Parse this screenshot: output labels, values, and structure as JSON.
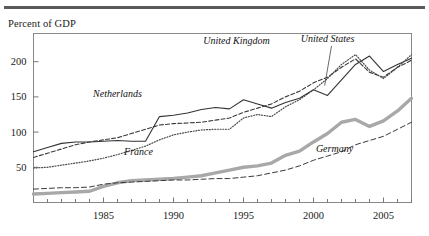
{
  "header": {
    "rule_color": "#5a5a5a"
  },
  "axis_title": "Percent of GDP",
  "chart_data": {
    "type": "line",
    "title": "",
    "subtitle": "",
    "xlabel": "",
    "ylabel": "Percent of GDP",
    "xlim": [
      1980,
      2007
    ],
    "ylim": [
      0,
      240
    ],
    "yticks": [
      50,
      100,
      150,
      200
    ],
    "ytick_labels": [
      "50",
      "100",
      "150",
      "200"
    ],
    "xticks": [
      1985,
      1990,
      1995,
      2000,
      2005
    ],
    "xtick_labels": [
      "1985",
      "1990",
      "1995",
      "2000",
      "2005"
    ],
    "minor_xticks_every": 1,
    "grid": false,
    "legend": "inline-annotations",
    "x": [
      1980,
      1981,
      1982,
      1983,
      1984,
      1985,
      1986,
      1987,
      1988,
      1989,
      1990,
      1991,
      1992,
      1993,
      1994,
      1995,
      1996,
      1997,
      1998,
      1999,
      2000,
      2001,
      2002,
      2003,
      2004,
      2005,
      2006,
      2007
    ],
    "series": [
      {
        "name": "Netherlands",
        "style": "solid-thin",
        "color": "#333333",
        "label_x": 1986.0,
        "label_y": 150,
        "values": [
          72,
          78,
          84,
          86,
          86,
          87,
          88,
          87,
          87,
          122,
          124,
          127,
          132,
          135,
          133,
          146,
          140,
          134,
          142,
          148,
          160,
          152,
          174,
          196,
          208,
          186,
          196,
          205
        ]
      },
      {
        "name": "United Kingdom",
        "style": "dotted",
        "color": "#4a4a4a",
        "label_x": 1994.5,
        "label_y": 225,
        "values": [
          49,
          50,
          53,
          56,
          59,
          63,
          68,
          74,
          80,
          89,
          96,
          100,
          103,
          104,
          104,
          120,
          125,
          122,
          136,
          146,
          160,
          176,
          196,
          210,
          188,
          176,
          192,
          210
        ]
      },
      {
        "name": "United States",
        "style": "dashed",
        "color": "#3a3a3a",
        "label_x": 2001.0,
        "label_y": 228,
        "leader_to_x": 2000.8,
        "leader_to_y": 166,
        "values": [
          64,
          70,
          76,
          82,
          86,
          89,
          92,
          98,
          104,
          110,
          112,
          113,
          114,
          117,
          120,
          128,
          134,
          140,
          150,
          158,
          170,
          178,
          192,
          204,
          185,
          178,
          192,
          202
        ]
      },
      {
        "name": "France",
        "style": "thick-gray",
        "color": "#a8a8a8",
        "label_x": 1987.5,
        "label_y": 68,
        "values": [
          12,
          13,
          14,
          15,
          16,
          23,
          28,
          31,
          32,
          33,
          34,
          36,
          38,
          42,
          46,
          50,
          52,
          56,
          67,
          73,
          86,
          98,
          114,
          118,
          108,
          116,
          130,
          148
        ]
      },
      {
        "name": "Germany",
        "style": "dashed-thin",
        "color": "#3a3a3a",
        "label_x": 2001.5,
        "label_y": 72,
        "values": [
          19,
          20,
          21,
          21,
          22,
          26,
          28,
          29,
          30,
          31,
          32,
          32,
          33,
          34,
          34,
          36,
          38,
          42,
          46,
          52,
          60,
          66,
          72,
          82,
          88,
          94,
          104,
          114
        ]
      }
    ]
  }
}
